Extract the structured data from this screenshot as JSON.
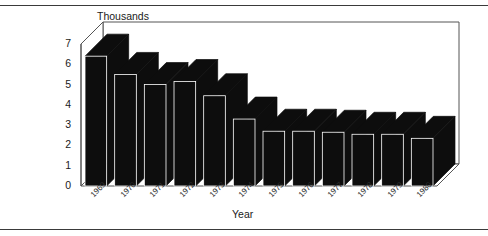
{
  "figure": {
    "background_color": "#ffffff",
    "frame_rule_color": "#3a3a3a",
    "bar_color": "#0d0d0d",
    "axis_color": "#555555"
  },
  "chart_data": {
    "type": "bar",
    "title": "Thousands",
    "subtitle": "",
    "xlabel": "Year",
    "ylabel": "",
    "ylim": [
      0,
      7
    ],
    "yticks": [
      0,
      1,
      2,
      3,
      4,
      5,
      6,
      7
    ],
    "ytick_labels": [
      "0",
      "1",
      "2",
      "3",
      "4",
      "5",
      "6",
      "7"
    ],
    "grid": false,
    "legend": null,
    "style": "3d-perspective-bar",
    "categories": [
      "1969",
      "1970",
      "1971",
      "1972",
      "1973",
      "1974",
      "1975",
      "1976",
      "1977",
      "1978",
      "1979",
      "1980"
    ],
    "values": [
      6.4,
      5.5,
      5.0,
      5.15,
      4.45,
      3.3,
      2.7,
      2.7,
      2.65,
      2.55,
      2.55,
      2.35
    ],
    "series": [
      {
        "name": "Thousands",
        "values": [
          6.4,
          5.5,
          5.0,
          5.15,
          4.45,
          3.3,
          2.7,
          2.7,
          2.65,
          2.55,
          2.55,
          2.35
        ]
      }
    ],
    "annotations": []
  }
}
